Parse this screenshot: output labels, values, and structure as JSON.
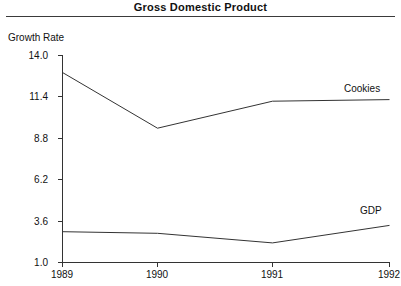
{
  "chart_data": {
    "type": "line",
    "title": "Gross Domestic Product",
    "xlabel": "",
    "ylabel": "Growth Rate",
    "x": [
      1989,
      1990,
      1991,
      1992
    ],
    "xticklabels": [
      "1989",
      "1990",
      "1991",
      "1992"
    ],
    "yticks": [
      1.0,
      3.6,
      6.2,
      8.8,
      11.4,
      14.0
    ],
    "yticklabels": [
      "1.0",
      "3.6",
      "6.2",
      "8.8",
      "11.4",
      "14.0"
    ],
    "ylim": [
      1.0,
      14.0
    ],
    "xlim": [
      1989,
      1992
    ],
    "grid": false,
    "legend": "inline-right-of-line-ends",
    "series": [
      {
        "name": "Cookies",
        "label": "Cookies",
        "values": [
          12.9,
          9.4,
          11.1,
          11.2
        ],
        "color": "#333333"
      },
      {
        "name": "GDP",
        "label": "GDP",
        "values": [
          2.9,
          2.8,
          2.2,
          3.3
        ],
        "color": "#333333"
      }
    ]
  },
  "axis": {
    "line_color": "#333333"
  }
}
